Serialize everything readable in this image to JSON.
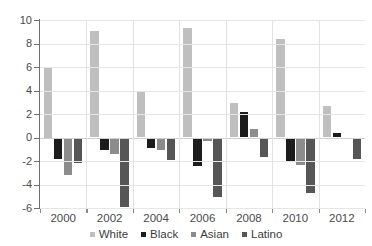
{
  "chart_data": {
    "type": "bar",
    "title": "",
    "subtitle": "",
    "xlabel": "",
    "ylabel": "",
    "ylim": [
      -6,
      10
    ],
    "ytick_labels": [
      "10",
      "8",
      "6",
      "4",
      "2",
      "0",
      "-2",
      "-4",
      "-6"
    ],
    "ytick_values": [
      10,
      8,
      6,
      4,
      2,
      0,
      -2,
      -4,
      -6
    ],
    "grid": true,
    "legend_position": "bottom",
    "categories": [
      "2000",
      "2002",
      "2004",
      "2006",
      "2008",
      "2010",
      "2012"
    ],
    "xtick_labels": [
      "2000",
      "2002",
      "2004",
      "2006",
      "2008",
      "2010",
      "2012"
    ],
    "series": [
      {
        "name": "White",
        "color": "#bfbfbf",
        "values": [
          6.0,
          9.05,
          3.85,
          9.3,
          2.95,
          8.4,
          2.65
        ]
      },
      {
        "name": "Black",
        "color": "#1c1c1c",
        "values": [
          -1.8,
          -1.1,
          -0.9,
          -2.45,
          2.2,
          -2.0,
          0.4
        ]
      },
      {
        "name": "Asian",
        "color": "#8c8c8c",
        "values": [
          -3.2,
          -1.4,
          -1.05,
          -0.3,
          0.7,
          -2.3,
          0.0
        ]
      },
      {
        "name": "Latino",
        "color": "#565656",
        "values": [
          -2.2,
          -5.95,
          -1.9,
          -5.1,
          -1.7,
          -4.7,
          -1.8
        ]
      }
    ]
  },
  "legend": {
    "items": [
      {
        "label": "White",
        "swatch": "white-swatch-icon"
      },
      {
        "label": "Black",
        "swatch": "black-swatch-icon"
      },
      {
        "label": "Asian",
        "swatch": "asian-swatch-icon"
      },
      {
        "label": "Latino",
        "swatch": "latino-swatch-icon"
      }
    ]
  }
}
